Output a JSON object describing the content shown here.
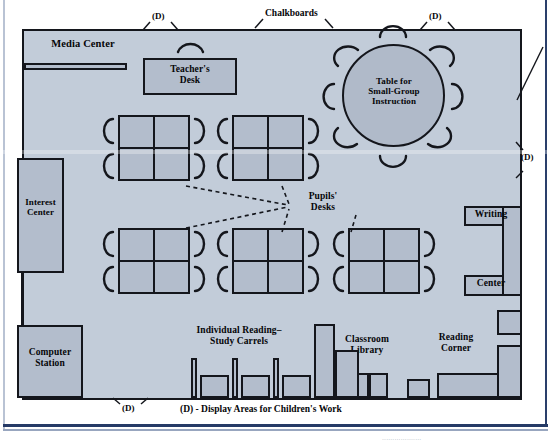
{
  "diagram": {
    "legend_text": "(D) - Display Areas for Children's Work",
    "display_marker": "(D)",
    "colors": {
      "floor": "#c2ccd9",
      "furniture": "#b3bdcc",
      "outline": "#14161c",
      "page_rule": "#253a66"
    },
    "caption_ghost": "..................."
  },
  "exterior_labels": [
    {
      "name": "chalkboards",
      "text": "Chalkboards"
    },
    {
      "name": "display-top-left",
      "text": "(D)"
    },
    {
      "name": "display-top-right",
      "text": "(D)"
    },
    {
      "name": "display-right",
      "text": "(D)"
    },
    {
      "name": "display-bottom",
      "text": "(D)"
    }
  ],
  "areas": [
    {
      "name": "media-center",
      "label": "Media Center"
    },
    {
      "name": "teachers-desk",
      "label": "Teacher's\nDesk"
    },
    {
      "name": "small-group-table",
      "label": "Table for\nSmall-Group\nInstruction"
    },
    {
      "name": "interest-center",
      "label": "Interest\nCenter"
    },
    {
      "name": "computer-station",
      "label": "Computer\nStation"
    },
    {
      "name": "writing-center-top",
      "label": "Writing"
    },
    {
      "name": "writing-center-bottom",
      "label": "Center"
    },
    {
      "name": "pupils-desks",
      "label": "Pupils'\nDesks"
    },
    {
      "name": "study-carrels",
      "label": "Individual Reading–\nStudy Carrels"
    },
    {
      "name": "classroom-library",
      "label": "Classroom\nLibrary"
    },
    {
      "name": "reading-corner",
      "label": "Reading\nCorner"
    }
  ],
  "desk_clusters": [
    {
      "name": "desk-cluster-1",
      "x": 118,
      "y": 115
    },
    {
      "name": "desk-cluster-2",
      "x": 232,
      "y": 115
    },
    {
      "name": "desk-cluster-3",
      "x": 118,
      "y": 228
    },
    {
      "name": "desk-cluster-4",
      "x": 232,
      "y": 228
    },
    {
      "name": "desk-cluster-5",
      "x": 348,
      "y": 228
    }
  ],
  "counts": {
    "desk_clusters": 5,
    "desks_per_cluster": 4,
    "round_table_chairs": 8,
    "study_carrels": 3
  }
}
